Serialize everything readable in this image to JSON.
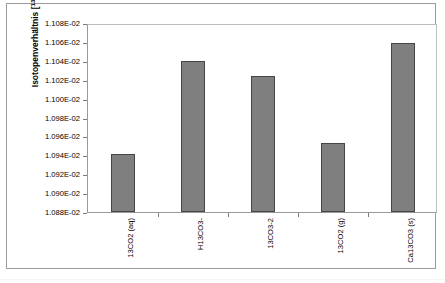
{
  "chart_data": {
    "type": "bar",
    "title": "",
    "xlabel": "",
    "ylabel": "Isotopenverhältnis [13C/12C]",
    "ylabel_main": "Isotopenverhältnis [",
    "ylabel_sup1": "13",
    "ylabel_mid": "C/",
    "ylabel_sup2": "12",
    "ylabel_end": "C]",
    "categories": [
      "13CO2 (aq)",
      "H13CO3-",
      "13CO3-2",
      "13CO2 (g)",
      "Ca13CO3 (s)"
    ],
    "values": [
      0.0109416,
      0.0110395,
      0.0110236,
      0.0109534,
      0.0110587
    ],
    "value_labels": [
      "1.09416E-02",
      "1.10395E-02",
      "1.10236E-02",
      "1.09534E-02",
      "1.10587E-02"
    ],
    "ylim": [
      0.01088,
      0.01108
    ],
    "ytick_values": [
      0.01108,
      0.01106,
      0.01104,
      0.01102,
      0.011,
      0.01098,
      0.01096,
      0.01094,
      0.01092,
      0.0109,
      0.01088
    ],
    "ytick_labels": [
      "1.108E-02",
      "1.106E-02",
      "1.104E-02",
      "1.102E-02",
      "1.100E-02",
      "1.098E-02",
      "1.096E-02",
      "1.094E-02",
      "1.092E-02",
      "1.090E-02",
      "1.088E-02"
    ],
    "grid": false,
    "legend": false,
    "bar_color": "#7f7f7f",
    "bar_border_color": "#454545",
    "axis_color": "#9a9a9a",
    "plot_background": "#ffffff",
    "figure_background": "#ffffff"
  }
}
